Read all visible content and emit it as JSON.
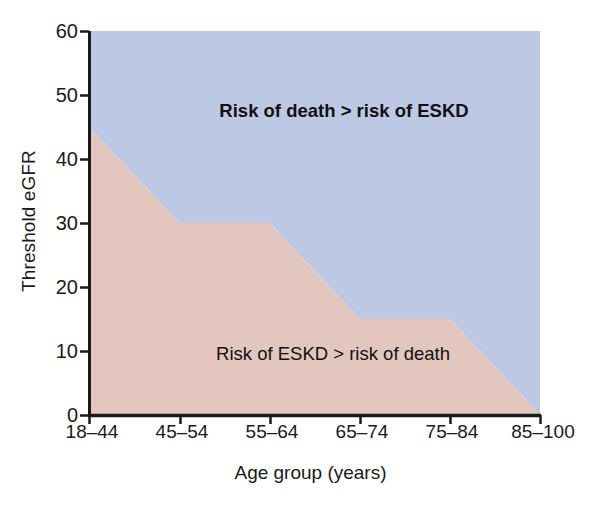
{
  "chart_data": {
    "type": "area",
    "title": "",
    "xlabel": "Age group (years)",
    "ylabel": "Threshold eGFR",
    "categories": [
      "18–44",
      "45–54",
      "55–64",
      "65–74",
      "75–84",
      "85–100"
    ],
    "x_tick_labels": [
      "18–44",
      "45–54",
      "55–64",
      "65–74",
      "75–84",
      "85–100"
    ],
    "y_tick_labels": [
      "0",
      "10",
      "20",
      "30",
      "40",
      "50",
      "60"
    ],
    "y_ticks": [
      0,
      10,
      20,
      30,
      40,
      50,
      60
    ],
    "ylim": [
      0,
      60
    ],
    "grid": false,
    "legend_position": "none",
    "series": [
      {
        "name": "Threshold eGFR boundary",
        "values": [
          45,
          30,
          30,
          15,
          15,
          0
        ]
      }
    ],
    "annotations": [
      {
        "text": "Risk of death > risk of ESKD",
        "region": "upper",
        "bold": true,
        "x_frac": 0.565,
        "y_value": 47.5
      },
      {
        "text": "Risk of ESKD > risk of death",
        "region": "lower",
        "bold": false,
        "x_frac": 0.54,
        "y_value": 9.5
      }
    ],
    "regions": [
      {
        "name": "risk-of-death-region",
        "label": "Risk of death > risk of ESKD",
        "color": "#bdc9e4"
      },
      {
        "name": "risk-of-eskd-region",
        "label": "Risk of ESKD > risk of death",
        "color": "#e3c6be"
      }
    ],
    "colors": {
      "upper_fill": "#bdc9e4",
      "lower_fill": "#e3c6be",
      "axis": "#1a1a1a",
      "text": "#1a1a1a",
      "background": "#ffffff"
    }
  }
}
